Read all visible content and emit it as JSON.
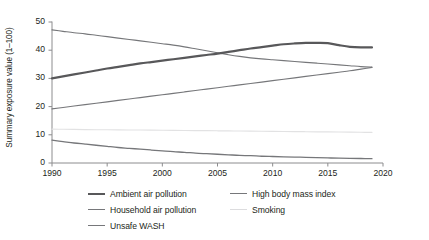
{
  "chart_data": {
    "type": "line",
    "title": "",
    "xlabel": "",
    "ylabel": "Summary exposure value (1–100)",
    "xlim": [
      1990,
      2020
    ],
    "ylim": [
      0,
      50
    ],
    "xticks": [
      "1990",
      "1995",
      "2000",
      "2005",
      "2010",
      "2015",
      "2020"
    ],
    "yticks": [
      "0",
      "10",
      "20",
      "30",
      "40",
      "50"
    ],
    "grid": false,
    "legend_position": "bottom",
    "x": [
      1990,
      1991,
      1992,
      1993,
      1994,
      1995,
      1996,
      1997,
      1998,
      1999,
      2000,
      2001,
      2002,
      2003,
      2004,
      2005,
      2006,
      2007,
      2008,
      2009,
      2010,
      2011,
      2012,
      2013,
      2014,
      2015,
      2016,
      2017,
      2018,
      2019
    ],
    "series": [
      {
        "name": "Ambient air pollution",
        "color": "#58585a",
        "width": 2.2,
        "values": [
          30.0,
          30.7,
          31.4,
          32.1,
          32.8,
          33.5,
          34.1,
          34.7,
          35.3,
          35.8,
          36.3,
          36.8,
          37.3,
          37.8,
          38.3,
          38.8,
          39.4,
          40.0,
          40.6,
          41.1,
          41.6,
          42.1,
          42.4,
          42.6,
          42.6,
          42.5,
          41.8,
          41.2,
          41.0,
          41.0
        ]
      },
      {
        "name": "Household air pollution",
        "color": "#76777a",
        "width": 1.15,
        "values": [
          47.2,
          46.7,
          46.2,
          45.8,
          45.3,
          44.8,
          44.3,
          43.8,
          43.3,
          42.8,
          42.3,
          41.8,
          41.2,
          40.5,
          39.8,
          39.1,
          38.4,
          37.8,
          37.3,
          36.9,
          36.6,
          36.3,
          36.0,
          35.7,
          35.4,
          35.1,
          34.8,
          34.5,
          34.2,
          34.0
        ]
      },
      {
        "name": "High body mass index",
        "color": "#76777a",
        "width": 1.15,
        "values": [
          19.2,
          19.7,
          20.2,
          20.7,
          21.2,
          21.7,
          22.2,
          22.7,
          23.2,
          23.7,
          24.2,
          24.7,
          25.2,
          25.7,
          26.2,
          26.7,
          27.2,
          27.7,
          28.2,
          28.7,
          29.2,
          29.7,
          30.2,
          30.7,
          31.2,
          31.7,
          32.2,
          32.7,
          33.3,
          33.9
        ]
      },
      {
        "name": "Smoking",
        "color": "#e2e2e3",
        "width": 1.15,
        "values": [
          12.0,
          11.95,
          11.9,
          11.85,
          11.8,
          11.78,
          11.75,
          11.72,
          11.69,
          11.66,
          11.62,
          11.58,
          11.54,
          11.5,
          11.46,
          11.42,
          11.38,
          11.34,
          11.3,
          11.26,
          11.22,
          11.18,
          11.14,
          11.1,
          11.06,
          11.02,
          10.98,
          10.94,
          10.9,
          10.86
        ]
      },
      {
        "name": "Unsafe WASH",
        "color": "#76777a",
        "width": 1.3,
        "values": [
          8.1,
          7.6,
          7.1,
          6.7,
          6.3,
          5.9,
          5.5,
          5.2,
          4.9,
          4.6,
          4.3,
          4.0,
          3.8,
          3.5,
          3.3,
          3.1,
          2.9,
          2.7,
          2.6,
          2.4,
          2.3,
          2.2,
          2.1,
          2.0,
          1.9,
          1.8,
          1.7,
          1.65,
          1.6,
          1.55
        ]
      }
    ]
  },
  "axis": {
    "ylabel": "Summary exposure value (1–100)",
    "yticks": [
      "50",
      "40",
      "30",
      "20",
      "10",
      "0"
    ],
    "xticks": [
      "1990",
      "1995",
      "2000",
      "2005",
      "2010",
      "2015",
      "2020"
    ]
  },
  "legend": {
    "items": [
      {
        "label": "Ambient air pollution",
        "color": "#58585a",
        "width": 2.4,
        "col": 0,
        "row": 0
      },
      {
        "label": "High body mass index",
        "color": "#76777a",
        "width": 1.7,
        "col": 1,
        "row": 0
      },
      {
        "label": "Household air pollution",
        "color": "#76777a",
        "width": 1.7,
        "col": 0,
        "row": 1
      },
      {
        "label": "Smoking",
        "color": "#dcdcde",
        "width": 1.6,
        "col": 1,
        "row": 1
      },
      {
        "label": "Unsafe WASH",
        "color": "#76777a",
        "width": 1.7,
        "col": 0,
        "row": 2
      }
    ]
  }
}
